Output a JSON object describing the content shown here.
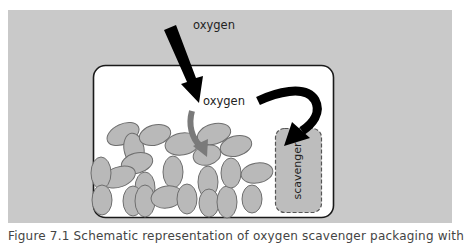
{
  "figure": {
    "labels": {
      "oxygen_outside": "oxygen",
      "oxygen_inside": "oxygen",
      "scavenger": "scavenger"
    },
    "caption": "Figure 7.1 Schematic representation of oxygen scavenger packaging with",
    "colors": {
      "page_background": "#ffffff",
      "panel_background": "#c9c9c9",
      "package_fill": "#ffffff",
      "package_stroke": "#1a1a1a",
      "product_fill": "#b9b9b9",
      "product_stroke": "#6e6e6e",
      "scavenger_fill": "#bdbdbd",
      "arrow_black": "#000000",
      "arrow_gray": "#7a7a7a",
      "text": "#222222"
    },
    "icons": {
      "oxygen_ingress_arrow": "straight-arrow-down",
      "oxygen_to_product_arrow": "curved-arrow-down",
      "oxygen_to_scavenger_arrow": "hook-arrow"
    }
  }
}
